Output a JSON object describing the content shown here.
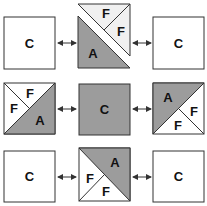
{
  "colors": {
    "gray": "#9c9c9c",
    "white": "#ffffff",
    "light": "#f0f0f0",
    "stroke": "#333333"
  },
  "labels": {
    "c": "C",
    "a": "A",
    "f": "F"
  },
  "grid": {
    "rows": [
      {
        "left": "C",
        "center": [
          "F",
          "F",
          "A"
        ],
        "right": "C"
      },
      {
        "left": [
          "F",
          "F",
          "A"
        ],
        "center": "C",
        "right": [
          "A",
          "F",
          "F"
        ]
      },
      {
        "left": "C",
        "center": [
          "A",
          "F",
          "F"
        ],
        "right": "C"
      }
    ]
  }
}
